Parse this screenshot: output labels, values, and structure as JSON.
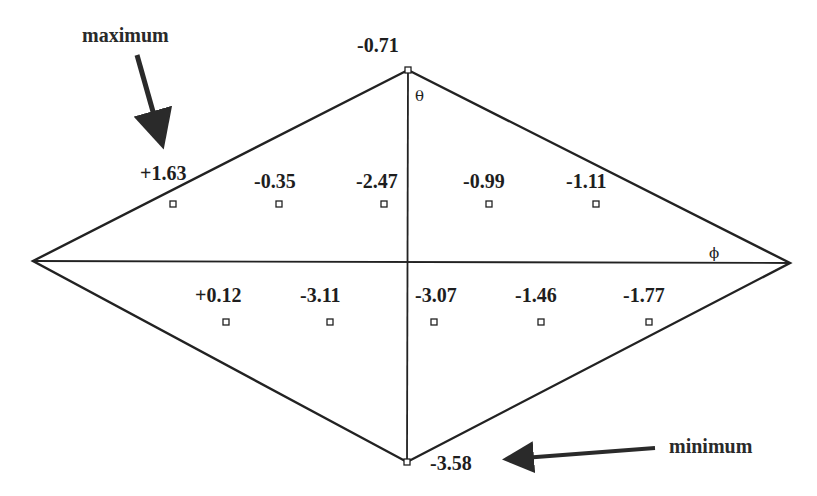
{
  "diagram": {
    "type": "rhombus-grid",
    "vertices": {
      "top": {
        "x": 408,
        "y": 70,
        "value": "-0.71"
      },
      "bottom": {
        "x": 407,
        "y": 462,
        "value": "-3.58"
      },
      "left": {
        "x": 33,
        "y": 261
      },
      "right": {
        "x": 790,
        "y": 263
      }
    },
    "axis_labels": {
      "theta": "θ",
      "phi": "ϕ"
    },
    "upper_row": [
      {
        "x": 173,
        "y": 204,
        "value": "+1.63"
      },
      {
        "x": 279,
        "y": 204,
        "value": "-0.35"
      },
      {
        "x": 384,
        "y": 204,
        "value": "-2.47"
      },
      {
        "x": 489,
        "y": 204,
        "value": "-0.99"
      },
      {
        "x": 596,
        "y": 204,
        "value": "-1.11"
      }
    ],
    "lower_row": [
      {
        "x": 226,
        "y": 322,
        "value": "+0.12"
      },
      {
        "x": 330,
        "y": 322,
        "value": "-3.11"
      },
      {
        "x": 434,
        "y": 322,
        "value": "-3.07"
      },
      {
        "x": 541,
        "y": 322,
        "value": "-1.46"
      },
      {
        "x": 649,
        "y": 322,
        "value": "-1.77"
      }
    ],
    "annotations": {
      "maximum": {
        "label": "maximum",
        "points_to": "+1.63"
      },
      "minimum": {
        "label": "minimum",
        "points_to": "-3.58"
      }
    }
  }
}
